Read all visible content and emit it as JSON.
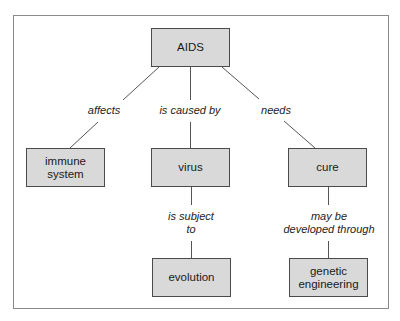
{
  "diagram": {
    "type": "concept-map",
    "colors": {
      "node_fill": "#d9d9d9",
      "node_border": "#4a4a4a",
      "line": "#555555",
      "frame": "#8a8a8a"
    },
    "nodes": {
      "aids": {
        "label": "AIDS"
      },
      "immune_system": {
        "label": "immune system"
      },
      "virus": {
        "label": "virus"
      },
      "cure": {
        "label": "cure"
      },
      "evolution": {
        "label": "evolution"
      },
      "genetic_engineering": {
        "label": "genetic engineering"
      }
    },
    "links": {
      "affects": {
        "label": "affects",
        "from": "AIDS",
        "to": "immune system"
      },
      "is_caused_by": {
        "label": "is caused by",
        "from": "AIDS",
        "to": "virus"
      },
      "needs": {
        "label": "needs",
        "from": "AIDS",
        "to": "cure"
      },
      "is_subject_to": {
        "label_line1": "is subject",
        "label_line2": "to",
        "from": "virus",
        "to": "evolution"
      },
      "may_be_developed_through": {
        "label_line1": "may be",
        "label_line2": "developed through",
        "from": "cure",
        "to": "genetic engineering"
      }
    }
  }
}
